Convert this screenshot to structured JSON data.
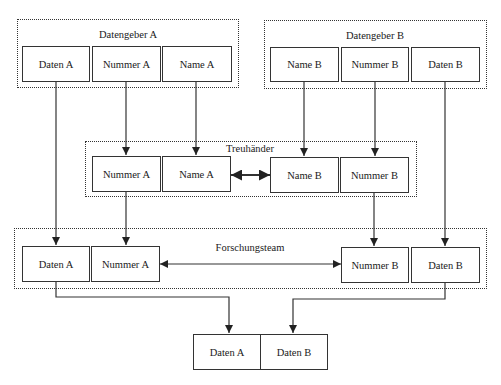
{
  "diagram": {
    "groups": {
      "datengeber_a": {
        "label": "Datengeber A"
      },
      "datengeber_b": {
        "label": "Datengeber B"
      },
      "treuhaender": {
        "label": "Treuhänder"
      },
      "forschungsteam": {
        "label": "Forschungsteam"
      }
    },
    "datengeber_a_boxes": [
      "Daten A",
      "Nummer A",
      "Name A"
    ],
    "datengeber_b_boxes": [
      "Name B",
      "Nummer B",
      "Daten B"
    ],
    "treuhaender_boxes": [
      "Nummer A",
      "Name A",
      "Name B",
      "Nummer B"
    ],
    "forschungsteam_boxes": [
      "Daten A",
      "Nummer A",
      "Nummer B",
      "Daten B"
    ],
    "result_boxes": [
      "Daten A",
      "Daten B"
    ],
    "edges": [
      {
        "from": "Datengeber A / Daten A",
        "to": "Forschungsteam / Daten A",
        "type": "arrow"
      },
      {
        "from": "Datengeber A / Nummer A",
        "to": "Treuhänder / Nummer A",
        "type": "arrow"
      },
      {
        "from": "Datengeber A / Name A",
        "to": "Treuhänder / Name A",
        "type": "arrow"
      },
      {
        "from": "Datengeber B / Name B",
        "to": "Treuhänder / Name B",
        "type": "arrow"
      },
      {
        "from": "Datengeber B / Nummer B",
        "to": "Treuhänder / Nummer B",
        "type": "arrow"
      },
      {
        "from": "Datengeber B / Daten B",
        "to": "Forschungsteam / Daten B",
        "type": "arrow"
      },
      {
        "from": "Treuhänder / Name A",
        "to": "Treuhänder / Name B",
        "type": "double-arrow"
      },
      {
        "from": "Treuhänder / Nummer A",
        "to": "Forschungsteam / Nummer A",
        "type": "arrow"
      },
      {
        "from": "Treuhänder / Nummer B",
        "to": "Forschungsteam / Nummer B",
        "type": "arrow"
      },
      {
        "from": "Forschungsteam / Nummer A",
        "to": "Forschungsteam / Nummer B",
        "type": "double-arrow"
      },
      {
        "from": "Forschungsteam / Daten A",
        "to": "Result / Daten A",
        "type": "arrow"
      },
      {
        "from": "Forschungsteam / Daten B",
        "to": "Result / Daten B",
        "type": "arrow"
      }
    ],
    "colors": {
      "line": "#333333",
      "background": "#ffffff",
      "text": "#1a1a1a"
    }
  }
}
